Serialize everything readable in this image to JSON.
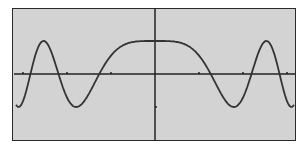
{
  "chart_data": {
    "type": "line",
    "title": "",
    "xlabel": "",
    "ylabel": "",
    "xlim": [
      -3.5,
      3.2
    ],
    "ylim": [
      -1.5,
      2.0
    ],
    "x_ticks": [
      -3,
      -2,
      -1,
      1,
      2,
      3
    ],
    "y_ticks": [
      -1
    ],
    "grid": false,
    "series": [
      {
        "name": "y1",
        "formula": "cos(x^2)",
        "color": "#333333"
      }
    ],
    "colors": {
      "screen_bg": "#d3d3d3",
      "axis": "#222222",
      "curve": "#333333"
    }
  }
}
